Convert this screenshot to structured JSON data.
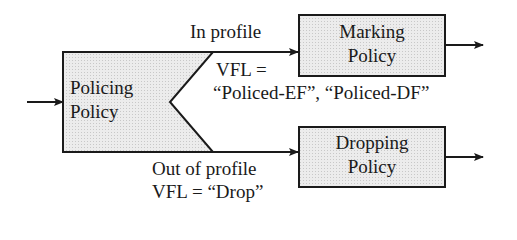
{
  "diagram": {
    "nodes": {
      "policing": {
        "line1": "Policing",
        "line2": "Policy"
      },
      "marking": {
        "line1": "Marking",
        "line2": "Policy"
      },
      "dropping": {
        "line1": "Dropping",
        "line2": "Policy"
      }
    },
    "edges": {
      "in_profile": {
        "label": "In profile",
        "vfl": "VFL =",
        "vfl_values": "“Policed-EF”, “Policed-DF”"
      },
      "out_profile": {
        "label": "Out of profile",
        "vfl": "VFL = “Drop”"
      }
    },
    "colors": {
      "box_fill": "#e6e6e6",
      "stroke": "#1a1a1a"
    }
  }
}
